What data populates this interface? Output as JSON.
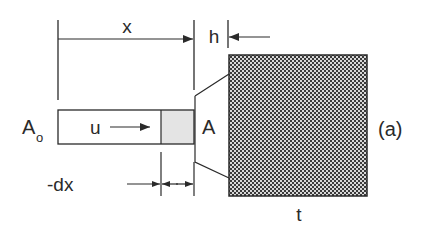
{
  "diagram": {
    "labels": {
      "x": "x",
      "h": "h",
      "A0_main": "A",
      "A0_sub": "o",
      "u": "u",
      "A": "A",
      "panel": "(a)",
      "t": "t",
      "dx": "-dx"
    },
    "colors": {
      "stroke": "#2a2a2a",
      "shaded": "#e4e4e4",
      "hatch_dark": "#3a3a3a",
      "hatch_light": "#d8d8d8",
      "background": "#ffffff"
    }
  }
}
